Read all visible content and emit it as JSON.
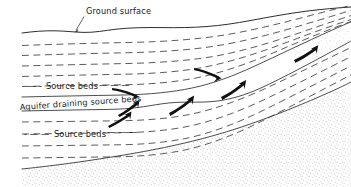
{
  "figure": {
    "title_visible": false,
    "background_color": "#ffffff",
    "width": 351,
    "height": 187,
    "line_color": "#3a3a3a",
    "arrow_color": "#111111",
    "text_color": "#1a1a1a"
  },
  "labels": {
    "ground_surface": "Ground surface",
    "source_beds_upper": "Source beds",
    "aquifer": "Aquifer draining source beds",
    "source_beds_lower": "Source beds"
  },
  "legend_marks": {
    "source_beds_upper_prefix": "—  -",
    "source_beds_upper_suffix": "—   —   —",
    "source_beds_lower_prefix": "-   —   —",
    "source_beds_lower_suffix": "—   —   —"
  },
  "geology": {
    "ground_surface_path": "M 22,33 C 40,30 55,31 70,32 C 88,33 100,30 118,28 C 140,26 160,27 182,27 C 205,27 225,25 245,22 C 268,18 290,14 310,11 C 325,9 340,8 351,7",
    "dashed_beds": [
      "M 22,45 C 60,43 100,42 140,41 C 175,40 205,37 232,32 C 262,27 290,20 320,13 C 335,9 345,7 351,5",
      "M 22,55 C 60,53 100,52 140,51 C 172,50 200,47 228,42 C 258,36 288,27 318,18 C 333,13 345,10 351,8",
      "M 22,65 C 60,63 100,62 140,61 C 170,60 196,57 222,52 C 252,45 282,35 312,24 C 330,17 344,13 351,11",
      "M 22,76 C 58,74 96,73 134,72 C 164,71 190,68 214,62 C 244,54 274,43 304,31 C 324,23 341,17 351,14",
      "M 22,86 C 56,85 92,84 128,83 C 156,82 180,78 204,72 C 232,64 262,52 292,39 C 314,29 336,21 351,17",
      "M 22,121 C 56,120 92,120 126,119 C 154,118 178,115 200,109 C 228,101 256,89 284,75 C 308,63 332,51 351,43",
      "M 22,133 C 56,132 92,132 126,131 C 152,130 176,127 198,121 C 226,113 254,100 282,86 C 306,74 332,61 351,52",
      "M 22,145 C 56,144 92,144 126,143 C 152,142 176,139 198,133 C 226,125 254,112 282,97 C 306,85 332,71 351,62",
      "M 22,157 C 56,156 92,156 126,155 C 152,154 174,151 196,145 C 224,137 252,124 280,109 C 306,96 332,82 351,73"
    ],
    "solid_beds": [
      "M 22,96 C 56,95 92,94 126,93 C 152,92 174,89 196,84 C 222,77 250,66 278,53 C 302,42 330,31 351,24",
      "M 22,110 C 54,109 88,108 120,107 C 142,106 160,104 176,101 C 192,98 206,95 220,93 C 236,91 252,87 268,79 C 292,68 322,53 351,40",
      "M 22,168 C 60,164 100,158 140,151 C 176,145 208,137 238,127 C 272,116 306,102 330,91 C 342,86 348,83 351,81"
    ],
    "basement_path": "M 22,168 C 60,164 100,158 140,151 C 176,145 208,137 238,127 C 272,116 306,102 330,91 C 342,86 348,83 351,81 L 351,187 L 22,187 Z",
    "upper_stipple_path": "M 351,7 C 340,8 325,9 310,11 C 290,14 268,18 245,22 C 248,30 260,40 275,50 C 295,63 325,78 351,90 Z"
  },
  "flow_arrows": [
    {
      "id": "arrow-1",
      "direction": "up-right",
      "x": 120,
      "y": 118,
      "note": "aquifer recharge lower-left"
    },
    {
      "id": "arrow-2",
      "direction": "up-right",
      "x": 133,
      "y": 107,
      "note": "aquifer recharge left"
    },
    {
      "id": "arrow-3",
      "direction": "down-right",
      "x": 124,
      "y": 93,
      "note": "downward leakage into aquifer"
    },
    {
      "id": "arrow-4",
      "direction": "up-right",
      "x": 180,
      "y": 104,
      "note": "aquifer flow mid"
    },
    {
      "id": "arrow-5",
      "direction": "down-right",
      "x": 207,
      "y": 76,
      "note": "downward leakage mid"
    },
    {
      "id": "arrow-6",
      "direction": "up-right",
      "x": 232,
      "y": 89,
      "note": "aquifer flow upper"
    },
    {
      "id": "arrow-7",
      "direction": "up-right",
      "x": 305,
      "y": 53,
      "note": "discharge far right"
    }
  ]
}
